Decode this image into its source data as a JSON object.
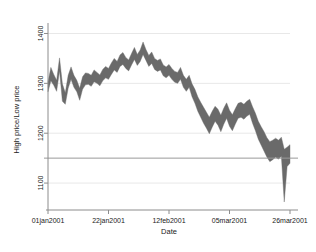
{
  "chart_data": {
    "type": "area",
    "title": "",
    "subtitle": "",
    "xlabel": "Date",
    "ylabel": "High price/Low price",
    "xlim": [
      "01jan2001",
      "26mar2001"
    ],
    "ylim": [
      1050,
      1405
    ],
    "grid": true,
    "legend": null,
    "series_style": "range band (high minus low) filled gray",
    "band_color": "#6a6a6a",
    "grid_color": "#e8e8e8",
    "reference_line": {
      "y": 1150,
      "color": "#9a9a9a",
      "label": ""
    },
    "y_ticks": [
      1100,
      1200,
      1300,
      1400
    ],
    "y_tick_labels": [
      "1100",
      "1200",
      "1300",
      "1400"
    ],
    "x_ticks": [
      "01jan2001",
      "22jan2001",
      "12feb2001",
      "05mar2001",
      "26mar2001"
    ],
    "x_tick_labels": [
      "01jan2001",
      "22jan2001",
      "12feb2001",
      "05mar2001",
      "26mar2001"
    ],
    "x_tick_day_index": [
      0,
      21,
      42,
      63,
      84
    ],
    "series": [
      {
        "name": "High price",
        "values": [
          1303,
          1332,
          1318,
          1306,
          1351,
          1299,
          1281,
          1316,
          1333,
          1316,
          1306,
          1290,
          1313,
          1321,
          1320,
          1316,
          1327,
          1322,
          1317,
          1328,
          1334,
          1330,
          1341,
          1350,
          1344,
          1357,
          1362,
          1352,
          1347,
          1360,
          1372,
          1358,
          1367,
          1383,
          1368,
          1356,
          1363,
          1350,
          1346,
          1349,
          1337,
          1333,
          1338,
          1330,
          1324,
          1322,
          1332,
          1316,
          1308,
          1316,
          1299,
          1288,
          1273,
          1262,
          1252,
          1242,
          1232,
          1244,
          1254,
          1248,
          1236,
          1250,
          1261,
          1246,
          1237,
          1249,
          1260,
          1262,
          1258,
          1264,
          1268,
          1253,
          1240,
          1224,
          1213,
          1203,
          1191,
          1183,
          1186,
          1190,
          1186,
          1192,
          1168,
          1172,
          1177
        ]
      },
      {
        "name": "Low price",
        "values": [
          1283,
          1305,
          1296,
          1284,
          1325,
          1264,
          1258,
          1290,
          1308,
          1292,
          1283,
          1266,
          1288,
          1297,
          1298,
          1294,
          1303,
          1300,
          1295,
          1305,
          1311,
          1308,
          1318,
          1327,
          1322,
          1334,
          1338,
          1330,
          1325,
          1337,
          1348,
          1336,
          1344,
          1358,
          1346,
          1334,
          1340,
          1328,
          1324,
          1327,
          1315,
          1311,
          1316,
          1308,
          1302,
          1300,
          1308,
          1292,
          1284,
          1292,
          1273,
          1260,
          1244,
          1232,
          1220,
          1210,
          1199,
          1212,
          1224,
          1216,
          1203,
          1218,
          1230,
          1214,
          1205,
          1218,
          1230,
          1232,
          1228,
          1234,
          1238,
          1220,
          1205,
          1188,
          1176,
          1164,
          1152,
          1143,
          1147,
          1152,
          1148,
          1154,
          1062,
          1133,
          1140
        ]
      }
    ]
  },
  "axes": {
    "y_title": "High price/Low price",
    "x_title": "Date"
  }
}
